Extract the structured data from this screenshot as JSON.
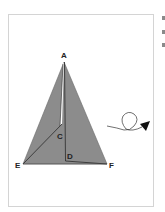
{
  "figure": {
    "type": "geometry-diagram",
    "points": {
      "A": {
        "label": "A",
        "x": 64,
        "y": 62
      },
      "E": {
        "label": "E",
        "x": 23,
        "y": 164
      },
      "F": {
        "label": "F",
        "x": 107,
        "y": 164
      },
      "C": {
        "label": "C",
        "x": 61,
        "y": 127
      },
      "D": {
        "label": "D",
        "x": 66,
        "y": 161
      }
    },
    "labels": {
      "A": "A",
      "C": "C",
      "D": "D",
      "E": "E",
      "F": "F"
    },
    "colors": {
      "triangle_fill": "#8c8c8c",
      "stroke": "#2a2a2a",
      "fold_gap": "#ffffff",
      "panel_border": "#d4d4d4"
    },
    "rotation_arrow": {
      "icon": "rotation-arrow-icon",
      "direction": "clockwise-loop-then-right"
    }
  }
}
